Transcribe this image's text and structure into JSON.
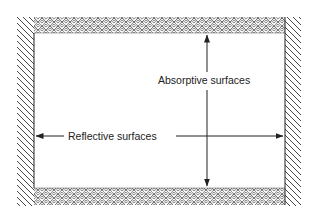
{
  "diagram": {
    "title": "",
    "labels": {
      "absorptive": "Absorptive surfaces",
      "reflective": "Reflective surfaces"
    },
    "elements": {
      "left_wall": "reflective (hatched)",
      "right_wall": "reflective (hatched)",
      "top_band": "absorptive (scalloped texture)",
      "bottom_band": "absorptive (scalloped texture)",
      "vertical_arrow": "double-headed, points to top and bottom absorptive surfaces",
      "horizontal_arrow": "double-headed, points to left and right reflective surfaces"
    },
    "colors": {
      "line": "#222222",
      "background": "#ffffff"
    }
  }
}
